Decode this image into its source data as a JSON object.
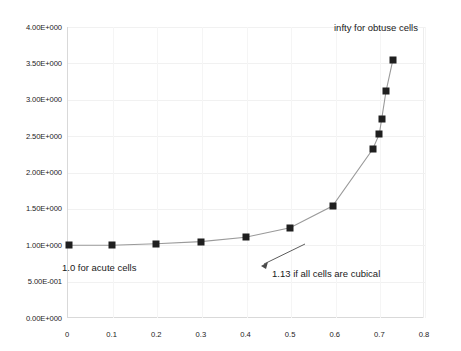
{
  "chart_data": {
    "type": "line",
    "title": "",
    "xlabel": "",
    "ylabel": "",
    "xlim": [
      0,
      0.8
    ],
    "ylim": [
      0,
      4.0
    ],
    "grid": true,
    "legend": "none",
    "marker": "square",
    "marker_color": "#1f1f1f",
    "line_color": "#9a9a9a",
    "x_ticks": [
      "0",
      "0.1",
      "0.2",
      "0.3",
      "0.4",
      "0.5",
      "0.6",
      "0.7",
      "0.8"
    ],
    "x_tick_values": [
      0,
      0.1,
      0.2,
      0.3,
      0.4,
      0.5,
      0.6,
      0.7,
      0.8
    ],
    "y_ticks": [
      "0.00E+000",
      "5.00E-001",
      "1.00E+000",
      "1.50E+000",
      "2.00E+000",
      "2.50E+000",
      "3.00E+000",
      "3.50E+000",
      "4.00E+000"
    ],
    "y_tick_values": [
      0,
      0.5,
      1.0,
      1.5,
      2.0,
      2.5,
      3.0,
      3.5,
      4.0
    ],
    "x": [
      0.005,
      0.1,
      0.2,
      0.3,
      0.4,
      0.5,
      0.595,
      0.685,
      0.7,
      0.705,
      0.715,
      0.73
    ],
    "y": [
      1.0,
      1.0,
      1.02,
      1.05,
      1.11,
      1.24,
      1.54,
      2.32,
      2.53,
      2.73,
      3.12,
      3.54
    ],
    "annotations": [
      {
        "id": "infty",
        "text": "infty for obtuse cells",
        "x": 0.73,
        "y": 3.95
      },
      {
        "id": "acute",
        "text": "1.0 for acute cells",
        "x": 0.0,
        "y": 0.82
      },
      {
        "id": "cubical",
        "text": "1.13 if all cells are cubical",
        "x": 0.48,
        "y": 0.74,
        "arrow_to": {
          "x": 0.42,
          "y": 1.12
        }
      }
    ]
  },
  "axis": {
    "y_labels": [
      "4.00E+000",
      "3.50E+000",
      "3.00E+000",
      "2.50E+000",
      "2.00E+000",
      "1.50E+000",
      "1.00E+000",
      "5.00E-001",
      "0.00E+000"
    ],
    "x_labels": [
      "0",
      "0.1",
      "0.2",
      "0.3",
      "0.4",
      "0.5",
      "0.6",
      "0.7",
      "0.8"
    ]
  },
  "annotations": {
    "infty": "infty for obtuse cells",
    "acute": "1.0 for acute cells",
    "cubical": "1.13 if all cells are cubical"
  }
}
